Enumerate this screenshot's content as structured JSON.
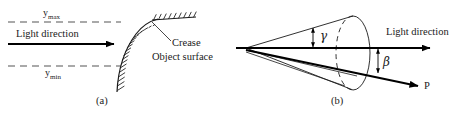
{
  "figure": {
    "caption_a": "(a)",
    "caption_b": "(b)",
    "panel_a": {
      "label_ymax": "y",
      "label_ymax_sub": "max",
      "label_ymin": "y",
      "label_ymin_sub": "min",
      "label_light_direction": "Light direction",
      "label_crease": "Crease",
      "label_object_surface": "Object surface"
    },
    "panel_b": {
      "label_light_direction": "Light direction",
      "label_gamma": "γ",
      "label_beta": "β",
      "label_p": "P"
    }
  },
  "colors": {
    "ink": "#1a1a1a",
    "line": "#000000",
    "dashed": "#555555",
    "background": "#ffffff"
  }
}
